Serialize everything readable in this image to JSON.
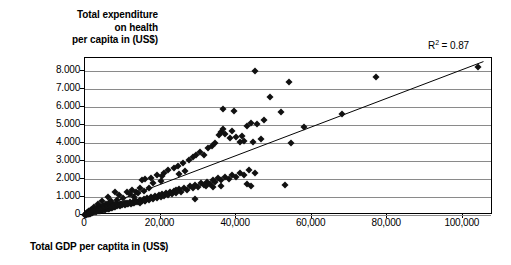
{
  "chart_data": {
    "type": "scatter",
    "title": "",
    "ylabel": "Total expenditure on health per capita in (US$)",
    "ylabel_lines": [
      "Total expenditure",
      "on health",
      "per capita in (US$)"
    ],
    "xlabel": "Total GDP per captita in (US$)",
    "xlim": [
      0,
      108000
    ],
    "ylim": [
      0,
      8700
    ],
    "yticks": [
      0,
      1000,
      2000,
      3000,
      4000,
      5000,
      6000,
      7000,
      8000
    ],
    "ytick_labels": [
      "0",
      "1.000",
      "2.000",
      "3.000",
      "4.000",
      "5.000",
      "6.000",
      "7.000",
      "8.000"
    ],
    "xticks": [
      0,
      20000,
      40000,
      60000,
      80000,
      100000
    ],
    "xtick_labels": [
      "0",
      "20,000",
      "40,000",
      "60,000",
      "80,000",
      "100,000"
    ],
    "grid": "horizontal",
    "legend": "none",
    "marker": "diamond",
    "marker_color": "#111111",
    "gridline_color": "#8a8a8a",
    "frame_color": "#000000",
    "annotations": [
      {
        "name": "r-squared",
        "text_prefix": "R",
        "text_sup": "2",
        "text_suffix": " = 0.87",
        "value": 0.87
      }
    ],
    "trendline": {
      "type": "linear",
      "x_start": 0,
      "y_start": 0,
      "x_end": 106000,
      "y_end": 8500
    },
    "points": [
      [
        400,
        30
      ],
      [
        600,
        40
      ],
      [
        700,
        55
      ],
      [
        800,
        45
      ],
      [
        900,
        70
      ],
      [
        1000,
        60
      ],
      [
        1100,
        90
      ],
      [
        1200,
        75
      ],
      [
        1300,
        110
      ],
      [
        1400,
        95
      ],
      [
        1500,
        130
      ],
      [
        1600,
        105
      ],
      [
        1700,
        150
      ],
      [
        1800,
        120
      ],
      [
        1900,
        160
      ],
      [
        2000,
        140
      ],
      [
        2200,
        175
      ],
      [
        2400,
        155
      ],
      [
        2600,
        200
      ],
      [
        2800,
        180
      ],
      [
        3000,
        220
      ],
      [
        3200,
        195
      ],
      [
        3400,
        240
      ],
      [
        3600,
        210
      ],
      [
        3800,
        265
      ],
      [
        4000,
        235
      ],
      [
        4200,
        290
      ],
      [
        4400,
        250
      ],
      [
        4600,
        310
      ],
      [
        4800,
        270
      ],
      [
        5000,
        330
      ],
      [
        5200,
        295
      ],
      [
        5400,
        355
      ],
      [
        5600,
        315
      ],
      [
        5800,
        380
      ],
      [
        6000,
        340
      ],
      [
        6200,
        405
      ],
      [
        6400,
        360
      ],
      [
        6600,
        430
      ],
      [
        6800,
        385
      ],
      [
        7000,
        455
      ],
      [
        7200,
        410
      ],
      [
        7400,
        480
      ],
      [
        7600,
        430
      ],
      [
        7800,
        505
      ],
      [
        8000,
        455
      ],
      [
        8300,
        530
      ],
      [
        8600,
        480
      ],
      [
        8900,
        560
      ],
      [
        9200,
        505
      ],
      [
        9500,
        590
      ],
      [
        9800,
        530
      ],
      [
        10200,
        620
      ],
      [
        10600,
        560
      ],
      [
        11000,
        650
      ],
      [
        11400,
        590
      ],
      [
        11800,
        690
      ],
      [
        12200,
        630
      ],
      [
        12600,
        730
      ],
      [
        13000,
        665
      ],
      [
        13500,
        775
      ],
      [
        14000,
        705
      ],
      [
        14500,
        820
      ],
      [
        15000,
        750
      ],
      [
        15500,
        870
      ],
      [
        16000,
        800
      ],
      [
        16500,
        920
      ],
      [
        17000,
        845
      ],
      [
        17500,
        975
      ],
      [
        18000,
        890
      ],
      [
        18500,
        1030
      ],
      [
        19000,
        940
      ],
      [
        19500,
        1090
      ],
      [
        20000,
        990
      ],
      [
        20500,
        1150
      ],
      [
        21000,
        1050
      ],
      [
        21500,
        1215
      ],
      [
        22000,
        1105
      ],
      [
        22500,
        1280
      ],
      [
        23000,
        1165
      ],
      [
        23500,
        1345
      ],
      [
        24000,
        1230
      ],
      [
        24800,
        1420
      ],
      [
        25500,
        1300
      ],
      [
        26200,
        1500
      ],
      [
        27000,
        1385
      ],
      [
        27800,
        1580
      ],
      [
        28500,
        1470
      ],
      [
        29200,
        1665
      ],
      [
        30000,
        1555
      ],
      [
        30800,
        1750
      ],
      [
        31500,
        1640
      ],
      [
        32200,
        1840
      ],
      [
        33000,
        1730
      ],
      [
        33800,
        1930
      ],
      [
        34500,
        1820
      ],
      [
        35200,
        2030
      ],
      [
        36000,
        1915
      ],
      [
        37000,
        2130
      ],
      [
        38000,
        2010
      ],
      [
        39000,
        2240
      ],
      [
        40000,
        2110
      ],
      [
        41000,
        2350
      ],
      [
        42000,
        2215
      ],
      [
        43500,
        2470
      ],
      [
        45000,
        2330
      ],
      [
        15000,
        1950
      ],
      [
        17500,
        2050
      ],
      [
        21000,
        2350
      ],
      [
        22000,
        2480
      ],
      [
        23500,
        2600
      ],
      [
        24500,
        2700
      ],
      [
        26000,
        2900
      ],
      [
        27500,
        3050
      ],
      [
        28500,
        3200
      ],
      [
        29500,
        3350
      ],
      [
        30500,
        3500
      ],
      [
        31500,
        3350
      ],
      [
        32500,
        3700
      ],
      [
        33500,
        3850
      ],
      [
        34500,
        4000
      ],
      [
        35500,
        4450
      ],
      [
        36000,
        4600
      ],
      [
        36500,
        4750
      ],
      [
        37000,
        4500
      ],
      [
        38500,
        4250
      ],
      [
        39000,
        4650
      ],
      [
        40000,
        4350
      ],
      [
        41000,
        4050
      ],
      [
        41500,
        4400
      ],
      [
        42000,
        4100
      ],
      [
        43000,
        4950
      ],
      [
        44000,
        5100
      ],
      [
        44500,
        4050
      ],
      [
        45500,
        5050
      ],
      [
        46500,
        4200
      ],
      [
        47500,
        5250
      ],
      [
        49000,
        6550
      ],
      [
        52000,
        5700
      ],
      [
        54000,
        7350
      ],
      [
        54500,
        4000
      ],
      [
        58000,
        4900
      ],
      [
        68000,
        5600
      ],
      [
        77000,
        7650
      ],
      [
        104000,
        8200
      ],
      [
        45000,
        8000
      ],
      [
        39500,
        5750
      ],
      [
        36500,
        5900
      ],
      [
        20000,
        1900
      ],
      [
        24000,
        1400
      ],
      [
        32000,
        1600
      ],
      [
        34000,
        1550
      ],
      [
        36000,
        1600
      ],
      [
        43000,
        1700
      ],
      [
        44000,
        1600
      ],
      [
        53000,
        1650
      ],
      [
        29000,
        900
      ],
      [
        16000,
        2000
      ],
      [
        11000,
        1250
      ],
      [
        12500,
        1400
      ],
      [
        13500,
        1300
      ],
      [
        14500,
        1500
      ],
      [
        9000,
        1100
      ],
      [
        10000,
        950
      ],
      [
        8500,
        850
      ],
      [
        7000,
        800
      ],
      [
        6500,
        700
      ],
      [
        5500,
        620
      ],
      [
        19000,
        2200
      ],
      [
        20500,
        2150
      ],
      [
        25000,
        2250
      ],
      [
        26500,
        2450
      ],
      [
        18000,
        1750
      ],
      [
        17000,
        1500
      ],
      [
        15500,
        1350
      ],
      [
        12000,
        1150
      ],
      [
        13000,
        1000
      ],
      [
        14000,
        1200
      ],
      [
        8000,
        1300
      ],
      [
        6000,
        1000
      ],
      [
        4500,
        800
      ],
      [
        3500,
        600
      ],
      [
        2500,
        450
      ],
      [
        2000,
        350
      ],
      [
        1500,
        280
      ],
      [
        1000,
        200
      ],
      [
        800,
        150
      ],
      [
        500,
        100
      ],
      [
        300,
        60
      ],
      [
        250,
        45
      ],
      [
        200,
        35
      ],
      [
        150,
        25
      ],
      [
        120,
        20
      ],
      [
        100,
        15
      ],
      [
        350,
        80
      ],
      [
        450,
        120
      ],
      [
        550,
        90
      ],
      [
        650,
        130
      ],
      [
        750,
        100
      ],
      [
        850,
        170
      ],
      [
        950,
        140
      ],
      [
        1150,
        210
      ],
      [
        1250,
        180
      ],
      [
        1350,
        230
      ],
      [
        1450,
        190
      ],
      [
        1550,
        250
      ],
      [
        1650,
        215
      ],
      [
        1750,
        270
      ],
      [
        1850,
        235
      ],
      [
        1950,
        300
      ],
      [
        2100,
        260
      ],
      [
        2300,
        320
      ],
      [
        2500,
        285
      ],
      [
        2700,
        350
      ],
      [
        2900,
        310
      ],
      [
        3100,
        375
      ],
      [
        3300,
        335
      ],
      [
        3500,
        400
      ],
      [
        3700,
        360
      ],
      [
        3900,
        425
      ],
      [
        4100,
        385
      ],
      [
        4300,
        450
      ],
      [
        4500,
        410
      ],
      [
        4700,
        475
      ],
      [
        4900,
        435
      ],
      [
        5100,
        500
      ],
      [
        5300,
        460
      ],
      [
        5700,
        525
      ],
      [
        6100,
        485
      ],
      [
        6500,
        550
      ],
      [
        6900,
        510
      ],
      [
        7300,
        575
      ],
      [
        7700,
        535
      ],
      [
        8100,
        600
      ],
      [
        8700,
        560
      ],
      [
        9300,
        625
      ],
      [
        9900,
        585
      ],
      [
        10500,
        660
      ],
      [
        11200,
        615
      ],
      [
        11900,
        700
      ],
      [
        12700,
        645
      ],
      [
        13600,
        740
      ],
      [
        14600,
        685
      ],
      [
        15800,
        780
      ]
    ]
  }
}
